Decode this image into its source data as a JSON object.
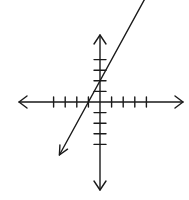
{
  "chart_data": {
    "type": "line",
    "title": "",
    "xlabel": "",
    "ylabel": "",
    "grid": false,
    "legend": null,
    "axes": {
      "x_ticks_negative": [
        -4,
        -3,
        -2,
        -1
      ],
      "x_ticks_positive": [
        1,
        2,
        3,
        4
      ],
      "y_ticks_positive": [
        1,
        2,
        3,
        4
      ],
      "y_ticks_negative": [
        -1,
        -2,
        -3,
        -4
      ],
      "arrows_on_axes": true,
      "tick_labels_shown": false
    },
    "xlim": [
      -7,
      7
    ],
    "ylim": [
      -7,
      7
    ],
    "series": [
      {
        "name": "line",
        "equation": "y = 2x + 2",
        "slope": 2,
        "y_intercept": 2,
        "x_intercept": -1,
        "x": [
          -3.5,
          -1,
          0,
          4.5
        ],
        "y": [
          -5,
          0,
          2,
          11
        ],
        "arrows_both_ends": true,
        "color": "#1a1a1a"
      }
    ]
  }
}
